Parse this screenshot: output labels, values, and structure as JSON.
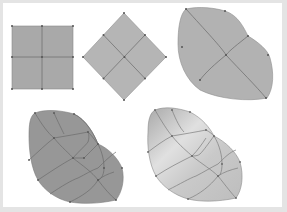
{
  "figure": {
    "colors": {
      "background": "#e4e4e4",
      "panel": "#ffffff",
      "square_fill": "#a9a9a9",
      "diamond_fill": "#b5b5b5",
      "blob1_fill": "#b2b2b2",
      "blob2_fill": "#979797",
      "blob3_light": "#e2e2e2",
      "blob3_dark": "#a8a8a8",
      "grid_line": "#727272",
      "point": "#555555"
    },
    "shapes": [
      {
        "name": "square-patch",
        "subdivisions": "2x2"
      },
      {
        "name": "diamond-patch",
        "subdivisions": "2x2"
      },
      {
        "name": "curved-patch-coarse",
        "subdivisions": "2x2"
      },
      {
        "name": "curved-patch-refined-flat",
        "subdivisions": "4x4"
      },
      {
        "name": "curved-patch-refined-shaded",
        "subdivisions": "4x4"
      }
    ]
  }
}
